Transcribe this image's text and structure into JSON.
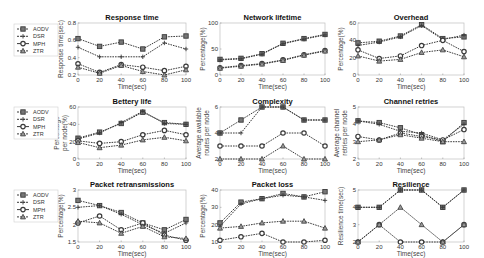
{
  "figure": {
    "legend_entries": [
      "AODV",
      "DSR",
      "MPH",
      "ZTR"
    ],
    "line_color": "#3a3a3a",
    "frame_color": "#bfbfbf"
  },
  "chart_data": [
    {
      "type": "line",
      "title": "Response time",
      "xlabel": "Time(sec)",
      "ylabel": [
        "Response time(sec)"
      ],
      "x": [
        0,
        20,
        40,
        60,
        80,
        100
      ],
      "xticks": [
        "0",
        "20",
        "40",
        "60",
        "80",
        "100"
      ],
      "ylim": [
        0.2,
        0.8
      ],
      "yticks": [
        "0.2",
        "0.4",
        "0.6",
        "0.8"
      ],
      "ytick_values": [
        0.2,
        0.4,
        0.6,
        0.8
      ],
      "legend": "left",
      "series": [
        {
          "name": "AODV",
          "marker": "square",
          "values": [
            0.62,
            0.53,
            0.58,
            0.5,
            0.64,
            0.65
          ]
        },
        {
          "name": "DSR",
          "marker": "plus",
          "values": [
            0.52,
            0.41,
            0.41,
            0.41,
            0.57,
            0.5
          ]
        },
        {
          "name": "MPH",
          "marker": "circle",
          "values": [
            0.33,
            0.23,
            0.32,
            0.29,
            0.25,
            0.3
          ]
        },
        {
          "name": "ZTR",
          "marker": "triangle",
          "values": [
            0.29,
            0.22,
            0.31,
            0.24,
            0.2,
            0.26
          ]
        }
      ]
    },
    {
      "type": "line",
      "title": "Network lifetime",
      "xlabel": "Time(sec)",
      "ylabel": [
        "Percentage(%)"
      ],
      "x": [
        0,
        20,
        40,
        60,
        80,
        100
      ],
      "xticks": [
        "0",
        "20",
        "40",
        "60",
        "80",
        "100"
      ],
      "ylim": [
        0,
        100
      ],
      "yticks": [
        "0",
        "50",
        "100"
      ],
      "ytick_values": [
        0,
        50,
        100
      ],
      "series": [
        {
          "name": "AODV",
          "marker": "square",
          "values": [
            30,
            32,
            41,
            61,
            70,
            78
          ]
        },
        {
          "name": "DSR",
          "marker": "plus",
          "values": [
            29,
            31,
            40,
            60,
            69,
            77
          ]
        },
        {
          "name": "MPH",
          "marker": "circle",
          "values": [
            14,
            18,
            22,
            29,
            39,
            47
          ]
        },
        {
          "name": "ZTR",
          "marker": "triangle",
          "values": [
            13,
            17,
            21,
            28,
            38,
            46
          ]
        }
      ]
    },
    {
      "type": "line",
      "title": "Overhead",
      "xlabel": "Time(sec)",
      "ylabel": [
        "Percentage(%)"
      ],
      "x": [
        0,
        20,
        40,
        60,
        80,
        100
      ],
      "xticks": [
        "0",
        "20",
        "40",
        "60",
        "80",
        "100"
      ],
      "ylim": [
        0,
        60
      ],
      "yticks": [
        "0",
        "20",
        "40",
        "60"
      ],
      "ytick_values": [
        0,
        20,
        40,
        60
      ],
      "series": [
        {
          "name": "AODV",
          "marker": "square",
          "values": [
            37,
            39,
            45,
            58,
            42,
            44
          ]
        },
        {
          "name": "DSR",
          "marker": "plus",
          "values": [
            34,
            38,
            44,
            57,
            41,
            46
          ]
        },
        {
          "name": "MPH",
          "marker": "circle",
          "values": [
            29,
            19,
            22,
            34,
            40,
            27
          ]
        },
        {
          "name": "ZTR",
          "marker": "triangle",
          "values": [
            22,
            16,
            18,
            26,
            29,
            21
          ]
        }
      ]
    },
    {
      "type": "line",
      "title": "Bettery life",
      "xlabel": "Time(sec)",
      "ylabel": [
        "Percentage",
        "per node(%)"
      ],
      "x": [
        0,
        20,
        40,
        60,
        80,
        100
      ],
      "xticks": [
        "0",
        "20",
        "40",
        "60",
        "80",
        "100"
      ],
      "ylim": [
        0,
        60
      ],
      "yticks": [
        "0",
        "20",
        "40",
        "60"
      ],
      "ytick_values": [
        0,
        20,
        40,
        60
      ],
      "legend": "left",
      "series": [
        {
          "name": "AODV",
          "marker": "square",
          "values": [
            24,
            31,
            41,
            54,
            42,
            40
          ]
        },
        {
          "name": "DSR",
          "marker": "plus",
          "values": [
            23,
            30,
            42,
            55,
            41,
            40
          ]
        },
        {
          "name": "MPH",
          "marker": "circle",
          "values": [
            21,
            18,
            20,
            28,
            33,
            28
          ]
        },
        {
          "name": "ZTR",
          "marker": "triangle",
          "values": [
            19,
            13,
            16,
            22,
            25,
            21
          ]
        }
      ]
    },
    {
      "type": "line",
      "title": "Complexity",
      "xlabel": "Time(sec)",
      "ylabel": [
        "Average available",
        "routes per node"
      ],
      "x": [
        0,
        20,
        40,
        60,
        80,
        100
      ],
      "xticks": [
        "0",
        "20",
        "40",
        "60",
        "80",
        "100"
      ],
      "ylim": [
        2,
        6
      ],
      "yticks": [
        "2",
        "4",
        "6"
      ],
      "ytick_values": [
        2,
        4,
        6
      ],
      "series": [
        {
          "name": "AODV",
          "marker": "square",
          "values": [
            4,
            5,
            6,
            6,
            5,
            5
          ]
        },
        {
          "name": "DSR",
          "marker": "plus",
          "values": [
            4,
            4,
            6,
            6,
            5,
            5
          ]
        },
        {
          "name": "MPH",
          "marker": "circle",
          "values": [
            3,
            3,
            3,
            4,
            4,
            3
          ]
        },
        {
          "name": "ZTR",
          "marker": "triangle",
          "values": [
            2,
            2,
            2,
            3,
            2,
            2
          ]
        }
      ]
    },
    {
      "type": "line",
      "title": "Channel retries",
      "xlabel": "Time(sec)",
      "ylabel": [
        "Average channel",
        "retries per node"
      ],
      "x": [
        0,
        20,
        40,
        60,
        80,
        100
      ],
      "xticks": [
        "0",
        "20",
        "40",
        "60",
        "80",
        "100"
      ],
      "ylim": [
        2,
        5
      ],
      "yticks": [
        "2",
        "3",
        "4",
        "5"
      ],
      "ytick_values": [
        2,
        3,
        4,
        5
      ],
      "series": [
        {
          "name": "AODV",
          "marker": "square",
          "values": [
            4.2,
            4.1,
            3.8,
            3.4,
            3.0,
            4.1
          ]
        },
        {
          "name": "DSR",
          "marker": "plus",
          "values": [
            4.2,
            4.0,
            3.6,
            3.5,
            3.1,
            4.0
          ]
        },
        {
          "name": "MPH",
          "marker": "circle",
          "values": [
            3.3,
            3.1,
            3.5,
            3.3,
            3.1,
            3.7
          ]
        },
        {
          "name": "ZTR",
          "marker": "triangle",
          "values": [
            3.0,
            3.1,
            3.4,
            3.2,
            3.0,
            3.0
          ]
        }
      ]
    },
    {
      "type": "line",
      "title": "Packet retransmissions",
      "xlabel": "Time(sec)",
      "ylabel": [
        "Percentage(%)"
      ],
      "x": [
        0,
        20,
        40,
        60,
        80,
        100
      ],
      "xticks": [
        "0",
        "20",
        "40",
        "60",
        "80",
        "100"
      ],
      "ylim": [
        1.5,
        3
      ],
      "yticks": [
        "1.5",
        "2",
        "2.5",
        "3"
      ],
      "ytick_values": [
        1.5,
        2,
        2.5,
        3
      ],
      "legend": "left",
      "series": [
        {
          "name": "AODV",
          "marker": "square",
          "values": [
            2.7,
            2.55,
            2.35,
            2.05,
            1.85,
            2.15
          ]
        },
        {
          "name": "DSR",
          "marker": "plus",
          "values": [
            2.5,
            2.55,
            2.3,
            2.0,
            1.75,
            2.05
          ]
        },
        {
          "name": "MPH",
          "marker": "circle",
          "values": [
            2.05,
            2.25,
            1.85,
            2.05,
            1.7,
            1.55
          ]
        },
        {
          "name": "ZTR",
          "marker": "triangle",
          "values": [
            2.1,
            2.05,
            1.75,
            1.95,
            1.65,
            1.6
          ]
        }
      ]
    },
    {
      "type": "line",
      "title": "Packet loss",
      "xlabel": "Time(sec)",
      "ylabel": [
        "Percentage(%)"
      ],
      "x": [
        0,
        20,
        40,
        60,
        80,
        100
      ],
      "xticks": [
        "0",
        "20",
        "40",
        "60",
        "80",
        "100"
      ],
      "ylim": [
        10,
        40
      ],
      "yticks": [
        "10",
        "20",
        "30",
        "40"
      ],
      "ytick_values": [
        10,
        20,
        30,
        40
      ],
      "series": [
        {
          "name": "AODV",
          "marker": "square",
          "values": [
            21,
            33,
            35,
            38,
            36,
            39
          ]
        },
        {
          "name": "DSR",
          "marker": "plus",
          "values": [
            19,
            32,
            35,
            37,
            36,
            34
          ]
        },
        {
          "name": "MPH",
          "marker": "circle",
          "values": [
            11,
            13,
            15,
            10,
            10,
            11
          ]
        },
        {
          "name": "ZTR",
          "marker": "triangle",
          "values": [
            18,
            19,
            21,
            22,
            22,
            18
          ]
        }
      ]
    },
    {
      "type": "line",
      "title": "Resilience",
      "xlabel": "Time(sec)",
      "ylabel": [
        "Resilience time(sec)"
      ],
      "x": [
        0,
        20,
        40,
        60,
        80,
        100
      ],
      "xticks": [
        "0",
        "20",
        "40",
        "60",
        "80",
        "100"
      ],
      "ylim": [
        2,
        5
      ],
      "yticks": [
        "2",
        "3",
        "4",
        "5"
      ],
      "ytick_values": [
        2,
        3,
        4,
        5
      ],
      "series": [
        {
          "name": "AODV",
          "marker": "square",
          "values": [
            4,
            4,
            5,
            5,
            4,
            5
          ]
        },
        {
          "name": "DSR",
          "marker": "plus",
          "values": [
            4,
            4,
            5,
            5,
            4,
            5
          ]
        },
        {
          "name": "MPH",
          "marker": "circle",
          "values": [
            2,
            3,
            2,
            2,
            2,
            3
          ]
        },
        {
          "name": "ZTR",
          "marker": "triangle",
          "values": [
            2,
            3,
            4,
            3,
            2,
            3
          ]
        }
      ]
    }
  ]
}
